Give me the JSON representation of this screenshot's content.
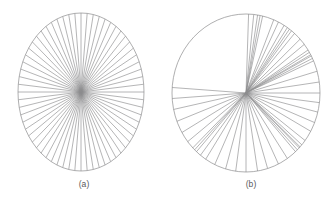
{
  "figure": {
    "background_color": "#ffffff",
    "line_color": "#8c8c8e",
    "caption_color": "#59595b",
    "panels": [
      {
        "id": "a",
        "caption": "(a)",
        "type": "radial-spoke-diagram",
        "description": "uniformly spaced radial spokes converging at an elliptical center",
        "center_x": 81,
        "center_y": 92,
        "radius_x": 63,
        "radius_y": 79,
        "spoke_count": 64,
        "uniform_spacing": true,
        "outline": true
      },
      {
        "id": "b",
        "caption": "(b)",
        "type": "radial-spoke-diagram",
        "description": "irregularly spaced radial spokes forming clustered bundles",
        "center_x": 80,
        "center_y": 93,
        "radius_x": 74,
        "radius_y": 79,
        "spoke_count": 52,
        "uniform_spacing": false,
        "outline": true
      }
    ]
  },
  "chart_data": {
    "type": "line",
    "title": "",
    "subtitle": "",
    "xlabel": "",
    "ylabel": "",
    "grid": false,
    "legend": "none",
    "panel_labels": [
      "(a)",
      "(b)"
    ],
    "series": [
      {
        "name": "(a) uniform radial spokes",
        "units": "degrees",
        "count": 64,
        "values": [
          0,
          5.625,
          11.25,
          16.875,
          22.5,
          28.125,
          33.75,
          39.375,
          45,
          50.625,
          56.25,
          61.875,
          67.5,
          73.125,
          78.75,
          84.375,
          90,
          95.625,
          101.25,
          106.875,
          112.5,
          118.125,
          123.75,
          129.375,
          135,
          140.625,
          146.25,
          151.875,
          157.5,
          163.125,
          168.75,
          174.375,
          180,
          185.625,
          191.25,
          196.875,
          202.5,
          208.125,
          213.75,
          219.375,
          225,
          230.625,
          236.25,
          241.875,
          247.5,
          253.125,
          258.75,
          264.375,
          270,
          275.625,
          281.25,
          286.875,
          292.5,
          298.125,
          303.75,
          309.375,
          315,
          320.625,
          326.25,
          331.875,
          337.5,
          343.125,
          348.75,
          354.375
        ]
      },
      {
        "name": "(b) clustered radial spokes",
        "units": "degrees",
        "count": 52,
        "values": [
          2,
          6,
          9,
          11,
          13,
          22,
          26,
          31,
          34,
          36,
          38,
          41,
          47,
          52,
          57,
          59,
          61,
          62,
          64,
          66,
          74,
          82,
          90,
          97,
          104,
          112,
          119,
          127,
          131,
          133,
          134,
          136,
          138,
          146,
          154,
          163,
          171,
          180,
          188,
          196,
          205,
          213,
          218,
          222,
          224,
          226,
          232,
          240,
          249,
          258,
          266,
          274
        ]
      }
    ]
  }
}
